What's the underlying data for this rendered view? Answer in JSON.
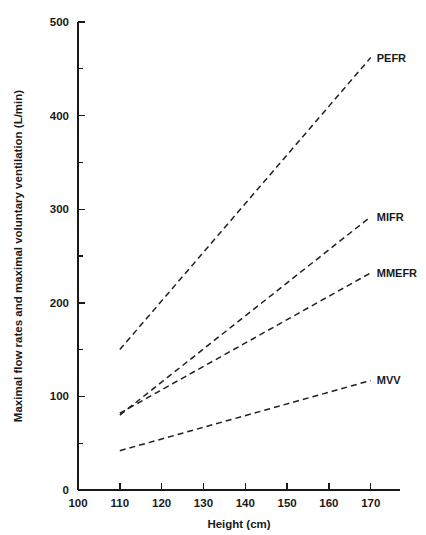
{
  "chart_data": {
    "type": "line",
    "title": "",
    "xlabel": "Height (cm)",
    "ylabel": "Maximal flow rates and maximal voluntary ventilation (L/min)",
    "xlim": [
      100,
      177
    ],
    "ylim": [
      0,
      500
    ],
    "grid": false,
    "legend_position": "inline-right-of-line-ends",
    "x_ticks": [
      100,
      110,
      120,
      130,
      140,
      150,
      160,
      170
    ],
    "x_tick_labels": [
      "100",
      "110",
      "120",
      "130",
      "140",
      "150",
      "160",
      "170"
    ],
    "y_ticks": [
      0,
      100,
      200,
      300,
      400,
      500
    ],
    "y_tick_labels": [
      "0",
      "100",
      "200",
      "300",
      "400",
      "500"
    ],
    "y_minor_ticks": [
      50,
      150,
      250,
      350,
      450
    ],
    "line_style": "dashed",
    "x": [
      110,
      170
    ],
    "series": [
      {
        "name": "PEFR",
        "label": "PEFR",
        "values": [
          150,
          462
        ]
      },
      {
        "name": "MIFR",
        "label": "MIFR",
        "values": [
          80,
          292
        ]
      },
      {
        "name": "MMEFR",
        "label": "MMEFR",
        "values": [
          82,
          232
        ]
      },
      {
        "name": "MVV",
        "label": "MVV",
        "values": [
          42,
          117
        ]
      }
    ]
  }
}
